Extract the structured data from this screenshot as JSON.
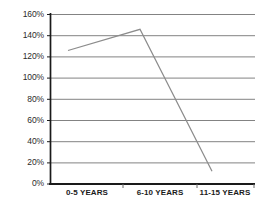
{
  "chart_data": {
    "type": "line",
    "title": "",
    "subtitle": "",
    "xlabel": "",
    "ylabel": "",
    "categories": [
      "0-5 YEARS",
      "6-10 YEARS",
      "11-15 YEARS"
    ],
    "series": [
      {
        "name": "",
        "values": [
          126,
          146,
          12
        ]
      }
    ],
    "ylim": [
      0,
      160
    ],
    "ytick_labels": [
      "160%",
      "140%",
      "120%",
      "100%",
      "80%",
      "60%",
      "40%",
      "20%",
      "0%"
    ],
    "ytick_values": [
      160,
      140,
      120,
      100,
      80,
      60,
      40,
      20,
      0
    ],
    "ytick_step": 20,
    "value_suffix": "%",
    "grid": {
      "horizontal": true,
      "vertical": false
    },
    "legend": {
      "visible": false,
      "position": "none",
      "entries": []
    },
    "colors": {
      "line": "#8c8c8c",
      "gridline": "#4d4d4d",
      "axis": "#1a1a1a",
      "text": "#231f20",
      "background": "#ffffff"
    },
    "annotations": []
  }
}
